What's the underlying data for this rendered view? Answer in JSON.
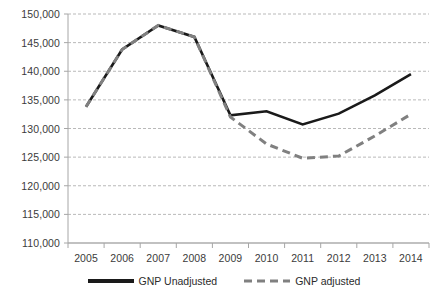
{
  "chart_data": {
    "type": "line",
    "title": "",
    "xlabel": "",
    "ylabel": "",
    "categories": [
      "2005",
      "2006",
      "2007",
      "2008",
      "2009",
      "2010",
      "2011",
      "2012",
      "2013",
      "2014"
    ],
    "series": [
      {
        "name": "GNP Unadjusted",
        "color": "#1a1a1a",
        "style": "solid",
        "values": [
          133800,
          143800,
          148000,
          146000,
          132300,
          133000,
          130700,
          132600,
          135800,
          139500
        ]
      },
      {
        "name": "GNP adjusted",
        "color": "#808080",
        "style": "dashed",
        "values": [
          133800,
          143800,
          148000,
          146000,
          132000,
          127300,
          124800,
          125200,
          128700,
          132500
        ]
      }
    ],
    "ylim": [
      110000,
      150000
    ],
    "ytick_values": [
      110000,
      115000,
      120000,
      125000,
      130000,
      135000,
      140000,
      145000,
      150000
    ],
    "ytick_labels": [
      "110,000",
      "115,000",
      "120,000",
      "125,000",
      "130,000",
      "135,000",
      "140,000",
      "145,000",
      "150,000"
    ],
    "grid": true,
    "grid_axis": "y",
    "legend_position": "bottom"
  },
  "legend": {
    "items": [
      {
        "label": "GNP Unadjusted",
        "color": "#1a1a1a",
        "style": "solid"
      },
      {
        "label": "GNP adjusted",
        "color": "#808080",
        "style": "dashed"
      }
    ]
  },
  "axes": {
    "axis_color": "#a6a6a6",
    "grid_color": "#b9b9b9",
    "tick_text_color": "#3b3b3b"
  }
}
